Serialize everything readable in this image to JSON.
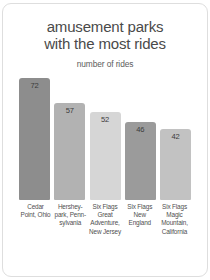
{
  "chart_data": {
    "type": "bar",
    "title": "amusement parks with the most rides",
    "title_line1": "amusement parks",
    "title_line2": "with the most rides",
    "subtitle": "number of rides",
    "xlabel": "",
    "ylabel": "number of rides",
    "ylim": [
      0,
      80
    ],
    "grid": false,
    "legend": "none",
    "categories": [
      "Cedar Point, Ohio",
      "Hershey-park, Penn-sylvania",
      "Six Flags Great Adventure, New Jersey",
      "Six Flags New England",
      "Six Flags Magic Mountain, California"
    ],
    "values": [
      72,
      57,
      52,
      46,
      42
    ],
    "value_labels": [
      "72",
      "57",
      "52",
      "46",
      "42"
    ],
    "bar_colors": [
      "#8d8d8d",
      "#b2b2b2",
      "#d6d6d6",
      "#9b9b9b",
      "#c2c2c2"
    ],
    "bars": [
      {
        "label": "Cedar Point, Ohio",
        "value": 72,
        "value_label": "72",
        "color": "#8d8d8d"
      },
      {
        "label": "Hershey-park, Penn-sylvania",
        "value": 57,
        "value_label": "57",
        "color": "#b2b2b2"
      },
      {
        "label": "Six Flags Great Adventure, New Jersey",
        "value": 52,
        "value_label": "52",
        "color": "#d6d6d6"
      },
      {
        "label": "Six Flags New England",
        "value": 46,
        "value_label": "46",
        "color": "#9b9b9b"
      },
      {
        "label": "Six Flags Magic Mountain, California",
        "value": 42,
        "value_label": "42",
        "color": "#c2c2c2"
      }
    ]
  },
  "colors": {
    "title_text": "#4a4a4a",
    "label_text": "#4f4f4f",
    "value_text": "#3c3c3c",
    "background": "#ffffff",
    "frame": "#dedede"
  }
}
